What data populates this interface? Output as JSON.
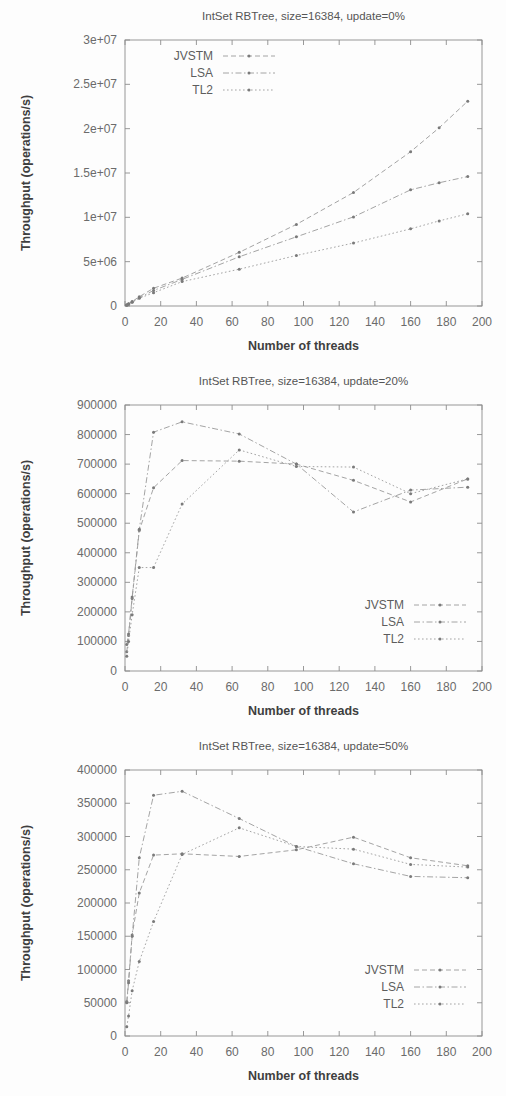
{
  "document": {
    "kind": "figure-sheet",
    "figure_count": 3
  },
  "common": {
    "xlabel": "Number of threads",
    "ylabel": "Throughput (operations/s)",
    "legend_entries": [
      "JVSTM",
      "LSA",
      "TL2"
    ],
    "xlim": [
      0,
      200
    ],
    "xticks": [
      0,
      20,
      40,
      60,
      80,
      100,
      120,
      140,
      160,
      180,
      200
    ],
    "xtick_labels": [
      "0",
      "20",
      "40",
      "60",
      "80",
      "100",
      "120",
      "140",
      "160",
      "180",
      "200"
    ],
    "grid": false,
    "line_color": "#9a9a9a",
    "text_color": "#5a5a5a",
    "frame_color": "#8d8d8d",
    "background": "#fdfdfd"
  },
  "chart_data": [
    {
      "id": "chart-update-0",
      "type": "line",
      "title": "IntSet RBTree, size=16384, update=0%",
      "xlabel": "Number of threads",
      "ylabel": "Throughput (operations/s)",
      "xlim": [
        0,
        200
      ],
      "ylim": [
        0,
        30000000
      ],
      "xticks": [
        0,
        20,
        40,
        60,
        80,
        100,
        120,
        140,
        160,
        180,
        200
      ],
      "yticks": [
        0,
        5000000,
        10000000,
        15000000,
        20000000,
        25000000,
        30000000
      ],
      "ytick_labels": [
        "0",
        "5e+06",
        "1e+07",
        "1.5e+07",
        "2e+07",
        "2.5e+07",
        "3e+07"
      ],
      "legend_position": "top-left",
      "grid": false,
      "series": [
        {
          "name": "JVSTM",
          "style": "dashed",
          "x": [
            1,
            2,
            4,
            8,
            16,
            32,
            64,
            96,
            128,
            160,
            176,
            192
          ],
          "values": [
            120000,
            250000,
            500000,
            1050000,
            2000000,
            3150000,
            6050000,
            9200000,
            12800000,
            17400000,
            20100000,
            23100000
          ]
        },
        {
          "name": "LSA",
          "style": "dash-dot",
          "x": [
            1,
            2,
            4,
            8,
            16,
            32,
            64,
            96,
            128,
            160,
            176,
            192
          ],
          "values": [
            110000,
            230000,
            460000,
            930000,
            1750000,
            3000000,
            5550000,
            7800000,
            10050000,
            13100000,
            13900000,
            14600000
          ]
        },
        {
          "name": "TL2",
          "style": "dotted",
          "x": [
            1,
            2,
            4,
            8,
            16,
            32,
            64,
            96,
            128,
            160,
            176,
            192
          ],
          "values": [
            100000,
            210000,
            420000,
            870000,
            1500000,
            2750000,
            4150000,
            5700000,
            7100000,
            8700000,
            9600000,
            10400000
          ]
        }
      ]
    },
    {
      "id": "chart-update-20",
      "type": "line",
      "title": "IntSet RBTree, size=16384, update=20%",
      "xlabel": "Number of threads",
      "ylabel": "Throughput (operations/s)",
      "xlim": [
        0,
        200
      ],
      "ylim": [
        0,
        900000
      ],
      "xticks": [
        0,
        20,
        40,
        60,
        80,
        100,
        120,
        140,
        160,
        180,
        200
      ],
      "yticks": [
        0,
        100000,
        200000,
        300000,
        400000,
        500000,
        600000,
        700000,
        800000,
        900000
      ],
      "ytick_labels": [
        "0",
        "100000",
        "200000",
        "300000",
        "400000",
        "500000",
        "600000",
        "700000",
        "800000",
        "900000"
      ],
      "legend_position": "bottom-right",
      "grid": false,
      "series": [
        {
          "name": "JVSTM",
          "style": "dashed",
          "x": [
            1,
            2,
            4,
            8,
            16,
            32,
            64,
            96,
            128,
            160,
            192
          ],
          "values": [
            65000,
            120000,
            245000,
            475000,
            620000,
            712000,
            710000,
            700000,
            645000,
            572000,
            650000
          ]
        },
        {
          "name": "LSA",
          "style": "dash-dot",
          "x": [
            1,
            2,
            4,
            8,
            16,
            32,
            64,
            96,
            128,
            160,
            192
          ],
          "values": [
            90000,
            125000,
            250000,
            480000,
            808000,
            843000,
            802000,
            700000,
            538000,
            612000,
            622000
          ]
        },
        {
          "name": "TL2",
          "style": "dotted",
          "x": [
            1,
            2,
            4,
            8,
            16,
            32,
            64,
            96,
            128,
            160,
            192
          ],
          "values": [
            50000,
            100000,
            190000,
            350000,
            350000,
            565000,
            748000,
            692000,
            690000,
            600000,
            650000
          ]
        }
      ]
    },
    {
      "id": "chart-update-50",
      "type": "line",
      "title": "IntSet RBTree, size=16384, update=50%",
      "xlabel": "Number of threads",
      "ylabel": "Throughput (operations/s)",
      "xlim": [
        0,
        200
      ],
      "ylim": [
        0,
        400000
      ],
      "xticks": [
        0,
        20,
        40,
        60,
        80,
        100,
        120,
        140,
        160,
        180,
        200
      ],
      "yticks": [
        0,
        50000,
        100000,
        150000,
        200000,
        250000,
        300000,
        350000,
        400000
      ],
      "ytick_labels": [
        "0",
        "50000",
        "100000",
        "150000",
        "200000",
        "250000",
        "300000",
        "350000",
        "400000"
      ],
      "legend_position": "bottom-right",
      "grid": false,
      "series": [
        {
          "name": "JVSTM",
          "style": "dashed",
          "x": [
            1,
            2,
            4,
            8,
            16,
            32,
            64,
            96,
            128,
            160,
            192
          ],
          "values": [
            52000,
            83000,
            152000,
            215000,
            272000,
            274000,
            270000,
            280000,
            299000,
            268000,
            256000
          ]
        },
        {
          "name": "LSA",
          "style": "dash-dot",
          "x": [
            1,
            2,
            4,
            8,
            16,
            32,
            64,
            96,
            128,
            160,
            192
          ],
          "values": [
            50000,
            80000,
            150000,
            268000,
            362000,
            368000,
            327000,
            285000,
            259000,
            240000,
            238000
          ]
        },
        {
          "name": "TL2",
          "style": "dotted",
          "x": [
            1,
            2,
            4,
            8,
            16,
            32,
            64,
            96,
            128,
            160,
            192
          ],
          "values": [
            14000,
            30000,
            68000,
            112000,
            172000,
            273000,
            313000,
            285000,
            281000,
            258000,
            254000
          ]
        }
      ]
    }
  ]
}
